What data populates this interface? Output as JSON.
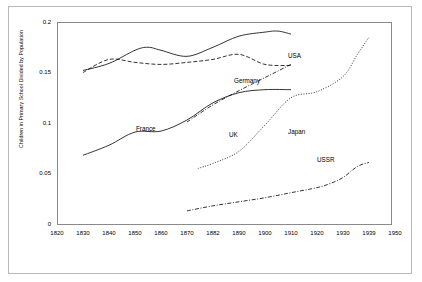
{
  "chart_data": {
    "type": "line",
    "title": "",
    "xlabel": "",
    "ylabel": "Children in Primary School Divided by Population",
    "xlim": [
      1820,
      1950
    ],
    "ylim": [
      0,
      0.2
    ],
    "grid": false,
    "legend_position": "inline-labels",
    "xticks": [
      "1820",
      "1830",
      "1840",
      "1850",
      "1860",
      "1870",
      "1882",
      "1890",
      "1900",
      "1910",
      "1920",
      "1930",
      "1939",
      "1950"
    ],
    "yticks": [
      "0",
      "0.05",
      "0.1",
      "0.15",
      "0.2"
    ],
    "series": [
      {
        "name": "USA",
        "style": "solid",
        "points": [
          [
            1830,
            0.152
          ],
          [
            1840,
            0.159
          ],
          [
            1850,
            0.172
          ],
          [
            1855,
            0.175
          ],
          [
            1860,
            0.172
          ],
          [
            1870,
            0.166
          ],
          [
            1882,
            0.175
          ],
          [
            1890,
            0.186
          ],
          [
            1900,
            0.19
          ],
          [
            1905,
            0.191
          ],
          [
            1910,
            0.188
          ]
        ]
      },
      {
        "name": "Germany",
        "style": "dashed",
        "points": [
          [
            1830,
            0.15
          ],
          [
            1840,
            0.163
          ],
          [
            1850,
            0.16
          ],
          [
            1860,
            0.158
          ],
          [
            1870,
            0.16
          ],
          [
            1882,
            0.163
          ],
          [
            1890,
            0.168
          ],
          [
            1900,
            0.158
          ],
          [
            1910,
            0.157
          ]
        ]
      },
      {
        "name": "France",
        "style": "solid",
        "points": [
          [
            1830,
            0.068
          ],
          [
            1840,
            0.078
          ],
          [
            1850,
            0.091
          ],
          [
            1860,
            0.092
          ],
          [
            1870,
            0.103
          ],
          [
            1882,
            0.12
          ],
          [
            1890,
            0.13
          ],
          [
            1900,
            0.133
          ],
          [
            1910,
            0.133
          ]
        ]
      },
      {
        "name": "UK",
        "style": "dash-dot",
        "points": [
          [
            1870,
            0.101
          ],
          [
            1882,
            0.118
          ],
          [
            1890,
            0.132
          ],
          [
            1900,
            0.145
          ],
          [
            1910,
            0.158
          ]
        ]
      },
      {
        "name": "Japan",
        "style": "dotted",
        "points": [
          [
            1875,
            0.055
          ],
          [
            1882,
            0.06
          ],
          [
            1890,
            0.072
          ],
          [
            1900,
            0.098
          ],
          [
            1910,
            0.125
          ],
          [
            1920,
            0.131
          ],
          [
            1930,
            0.146
          ],
          [
            1935,
            0.168
          ],
          [
            1939,
            0.185
          ]
        ]
      },
      {
        "name": "USSR",
        "style": "dash-dot",
        "points": [
          [
            1870,
            0.013
          ],
          [
            1882,
            0.018
          ],
          [
            1890,
            0.022
          ],
          [
            1900,
            0.026
          ],
          [
            1910,
            0.031
          ],
          [
            1920,
            0.036
          ],
          [
            1925,
            0.04
          ],
          [
            1930,
            0.046
          ],
          [
            1935,
            0.057
          ],
          [
            1939,
            0.061
          ]
        ]
      }
    ],
    "annotations": [
      {
        "text": "USA",
        "x": 1903,
        "y": 0.198
      },
      {
        "text": "Germany",
        "x": 1884,
        "y": 0.176
      },
      {
        "text": "France",
        "x": 1861,
        "y": 0.128
      },
      {
        "text": "UK",
        "x": 1894,
        "y": 0.122
      },
      {
        "text": "Japan",
        "x": 1915,
        "y": 0.122
      },
      {
        "text": "USSR",
        "x": 1926,
        "y": 0.096
      }
    ]
  }
}
